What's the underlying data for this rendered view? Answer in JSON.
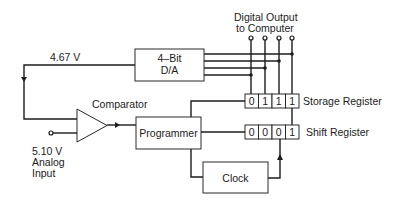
{
  "diagram": {
    "labels": {
      "feedback_voltage": "4.67 V",
      "digital_output_line1": "Digital Output",
      "digital_output_line2": "to Computer",
      "analog_voltage": "5.10 V",
      "analog_line2": "Analog",
      "analog_line3": "Input"
    },
    "blocks": {
      "dac_line1": "4–Bit",
      "dac_line2": "D/A",
      "comparator": "Comparator",
      "programmer": "Programmer",
      "clock": "Clock",
      "storage_register": "Storage Register",
      "shift_register": "Shift Register"
    },
    "registers": {
      "storage_bits": [
        "0",
        "1",
        "1",
        "1"
      ],
      "shift_bits": [
        "0",
        "0",
        "0",
        "1"
      ]
    },
    "colors": {
      "ink": "#1c1c1c",
      "background": "#ffffff"
    }
  }
}
